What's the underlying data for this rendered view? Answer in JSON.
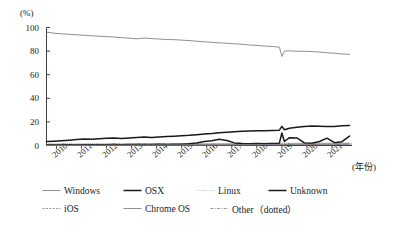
{
  "chart_data": {
    "type": "line",
    "title": "",
    "subtitle": "",
    "xlabel": "(年份)",
    "ylabel": "(%)",
    "ylim": [
      0,
      100
    ],
    "yticks": [
      0,
      20,
      40,
      60,
      80,
      100
    ],
    "xlim": [
      2009.6,
      2021.8
    ],
    "xticks": [
      "2010",
      "2011",
      "2012",
      "2013",
      "2014",
      "2015",
      "2016",
      "2017",
      "2018",
      "2019",
      "2020",
      "2021"
    ],
    "grid": false,
    "legend_position": "bottom",
    "x": [
      2009.6,
      2009.9,
      2010.2,
      2010.5,
      2010.8,
      2011.1,
      2011.4,
      2011.7,
      2012.0,
      2012.3,
      2012.6,
      2012.9,
      2013.2,
      2013.5,
      2013.8,
      2014.1,
      2014.4,
      2014.7,
      2015.0,
      2015.3,
      2015.6,
      2015.9,
      2016.2,
      2016.5,
      2016.8,
      2017.1,
      2017.4,
      2017.7,
      2018.0,
      2018.3,
      2018.6,
      2018.9,
      2019.0,
      2019.1,
      2019.3,
      2019.6,
      2019.9,
      2020.2,
      2020.5,
      2020.8,
      2021.1,
      2021.4,
      2021.7
    ],
    "series": [
      {
        "name": "Windows",
        "style": "thin-solid",
        "color": "#6b6b6b",
        "values": [
          96.0,
          95.2,
          94.6,
          94.2,
          93.8,
          93.4,
          93.0,
          92.6,
          92.3,
          91.9,
          91.4,
          91.0,
          90.4,
          91.1,
          90.6,
          90.2,
          89.8,
          89.7,
          89.3,
          88.9,
          88.4,
          87.9,
          87.4,
          87.0,
          86.6,
          86.2,
          85.8,
          85.2,
          84.8,
          84.3,
          83.9,
          83.4,
          75.5,
          80.0,
          80.2,
          79.8,
          79.9,
          79.6,
          79.2,
          78.6,
          78.2,
          77.6,
          77.2
        ]
      },
      {
        "name": "OSX",
        "style": "thick-solid",
        "color": "#1a1a1a",
        "values": [
          3.3,
          3.6,
          4.0,
          4.5,
          5.0,
          5.6,
          5.4,
          5.8,
          6.1,
          6.3,
          6.0,
          6.4,
          6.8,
          7.1,
          6.8,
          7.3,
          7.6,
          7.9,
          8.2,
          8.6,
          9.2,
          9.8,
          10.2,
          10.8,
          11.2,
          11.6,
          12.0,
          12.2,
          12.4,
          12.6,
          12.8,
          13.0,
          16.2,
          13.4,
          14.6,
          15.4,
          16.1,
          16.6,
          16.4,
          16.0,
          16.2,
          16.8,
          17.0
        ]
      },
      {
        "name": "Linux",
        "style": "dotted-thin",
        "color": "#9a9a9a",
        "values": [
          0.9,
          0.9,
          1.0,
          1.0,
          1.0,
          1.1,
          1.1,
          1.1,
          1.2,
          1.2,
          1.2,
          1.3,
          1.3,
          1.3,
          1.4,
          1.4,
          1.4,
          1.5,
          1.5,
          1.5,
          1.6,
          1.6,
          1.6,
          1.7,
          1.7,
          1.7,
          1.8,
          1.8,
          1.8,
          1.9,
          1.9,
          1.9,
          2.0,
          2.0,
          2.0,
          2.0,
          2.1,
          2.1,
          2.1,
          2.2,
          2.2,
          2.2,
          2.3
        ]
      },
      {
        "name": "Unknown",
        "style": "thick-solid",
        "color": "#1a1a1a",
        "values": [
          0.4,
          0.4,
          0.5,
          0.6,
          0.5,
          0.6,
          0.7,
          0.6,
          0.7,
          0.8,
          0.7,
          0.8,
          0.9,
          0.8,
          0.9,
          1.0,
          0.9,
          1.0,
          1.1,
          1.4,
          2.2,
          3.4,
          4.0,
          5.2,
          4.2,
          2.2,
          1.6,
          1.5,
          1.6,
          1.5,
          1.7,
          2.0,
          10.6,
          3.4,
          6.6,
          6.4,
          2.2,
          1.9,
          3.4,
          6.2,
          2.4,
          3.2,
          8.0
        ]
      },
      {
        "name": "iOS",
        "style": "dashed-thin",
        "color": "#555555",
        "values": [
          0.2,
          0.2,
          0.3,
          0.3,
          0.3,
          0.4,
          0.4,
          0.4,
          0.5,
          0.5,
          0.5,
          0.6,
          0.6,
          0.6,
          0.6,
          0.7,
          0.7,
          0.7,
          0.7,
          0.8,
          0.8,
          0.8,
          0.8,
          0.9,
          0.9,
          0.9,
          0.9,
          1.0,
          1.0,
          1.0,
          1.0,
          1.1,
          1.1,
          1.1,
          1.1,
          1.2,
          1.2,
          1.2,
          1.2,
          1.3,
          1.3,
          1.3,
          1.4
        ]
      },
      {
        "name": "Chrome OS",
        "style": "thin-solid",
        "color": "#8a8a8a",
        "values": [
          0.0,
          0.0,
          0.0,
          0.1,
          0.1,
          0.1,
          0.1,
          0.1,
          0.2,
          0.2,
          0.2,
          0.2,
          0.3,
          0.3,
          0.3,
          0.3,
          0.4,
          0.4,
          0.4,
          0.4,
          0.5,
          0.5,
          0.5,
          0.6,
          0.6,
          0.6,
          0.7,
          0.7,
          0.7,
          0.8,
          0.8,
          0.8,
          0.9,
          0.9,
          0.9,
          1.0,
          1.0,
          1.0,
          1.1,
          1.1,
          1.2,
          1.2,
          1.3
        ]
      },
      {
        "name": "Other（dotted）",
        "style": "dash-dot-thin",
        "color": "#7a7a7a",
        "values": [
          0.1,
          0.1,
          0.1,
          0.1,
          0.1,
          0.2,
          0.2,
          0.2,
          0.2,
          0.2,
          0.2,
          0.2,
          0.3,
          0.3,
          0.3,
          0.3,
          0.3,
          0.3,
          0.3,
          0.4,
          0.4,
          0.4,
          0.4,
          0.4,
          0.4,
          0.4,
          0.5,
          0.5,
          0.5,
          0.5,
          0.5,
          0.5,
          0.5,
          0.6,
          0.6,
          0.6,
          0.6,
          0.6,
          0.6,
          0.7,
          0.7,
          0.7,
          0.7
        ]
      }
    ]
  },
  "legend": {
    "row1": [
      {
        "label": "Windows",
        "style": "thin-solid"
      },
      {
        "label": "OSX",
        "style": "thick-solid"
      },
      {
        "label": "Linux",
        "style": "dotted-thin"
      },
      {
        "label": "Unknown",
        "style": "thick-solid"
      }
    ],
    "row2": [
      {
        "label": "iOS",
        "style": "dashed-thin"
      },
      {
        "label": "Chrome OS",
        "style": "thin-solid"
      },
      {
        "label": "Other（dotted）",
        "style": "dash-dot-thin"
      }
    ]
  }
}
